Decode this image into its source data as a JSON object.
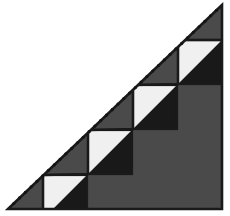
{
  "figure": {
    "type": "geometric-diagram",
    "canvas": {
      "width": 230,
      "height": 216,
      "background": "#ffffff"
    },
    "colors": {
      "background": "#ffffff",
      "gray_fill": "#4a4a4a",
      "black_fill": "#191919",
      "white_fill": "#f0f0f0",
      "outline": "#1a1a1a",
      "dotted_line": "#141414"
    },
    "triangle": {
      "name": "outer-right-triangle",
      "apex": {
        "x": 222,
        "y": 5
      },
      "bottom_left": {
        "x": 8,
        "y": 209
      },
      "bottom_right": {
        "x": 222,
        "y": 209
      },
      "points": "222,5 8,209 222,209"
    },
    "hypotenuse": {
      "name": "dotted-hypotenuse",
      "from": {
        "x": 8,
        "y": 209
      },
      "to": {
        "x": 222,
        "y": 5
      },
      "style": "dotted",
      "dot_radius": 1.6,
      "dot_spacing": 8
    },
    "steps": [
      {
        "index": 1,
        "x": 178,
        "y": 40,
        "size": 44,
        "white_corner": "upper-left",
        "black_corner": "lower-right"
      },
      {
        "index": 2,
        "x": 133,
        "y": 85,
        "size": 44,
        "white_corner": "upper-left",
        "black_corner": "lower-right"
      },
      {
        "index": 3,
        "x": 88,
        "y": 130,
        "size": 44,
        "white_corner": "upper-left",
        "black_corner": "lower-right"
      },
      {
        "index": 4,
        "x": 43,
        "y": 175,
        "size": 44,
        "white_corner": "upper-left",
        "black_corner": "lower-right"
      }
    ],
    "step_count": 4
  }
}
